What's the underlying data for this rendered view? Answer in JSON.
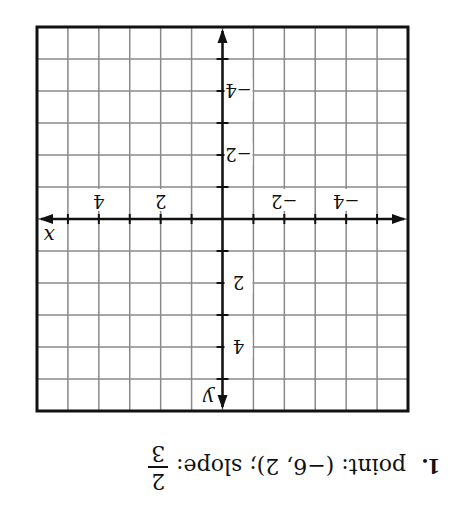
{
  "problem": {
    "number": "1.",
    "text": "point: (−6, 2); slope:",
    "slope_numerator": "2",
    "slope_denominator": "3"
  },
  "chart_data": {
    "type": "coordinate-grid",
    "orientation_note": "screenshot is rotated 180 degrees",
    "xlabel": "x",
    "ylabel": "y",
    "xlim": [
      -6,
      6
    ],
    "ylim": [
      -6,
      6
    ],
    "grid": true,
    "x_tick_labels": [
      "-4",
      "-2",
      "2",
      "4"
    ],
    "y_tick_labels": [
      "-4",
      "-2",
      "2",
      "4"
    ],
    "point": [
      -6,
      2
    ],
    "slope": "2/3"
  },
  "graph": {
    "x_axis_label": "x",
    "y_axis_label": "y",
    "x_ticks": [
      {
        "value": -4,
        "label": "−4"
      },
      {
        "value": -2,
        "label": "−2"
      },
      {
        "value": 2,
        "label": "2"
      },
      {
        "value": 4,
        "label": "4"
      }
    ],
    "y_ticks": [
      {
        "value": 4,
        "label": "4"
      },
      {
        "value": 2,
        "label": "2"
      },
      {
        "value": -2,
        "label": "−2"
      },
      {
        "value": -4,
        "label": "−4"
      }
    ]
  }
}
